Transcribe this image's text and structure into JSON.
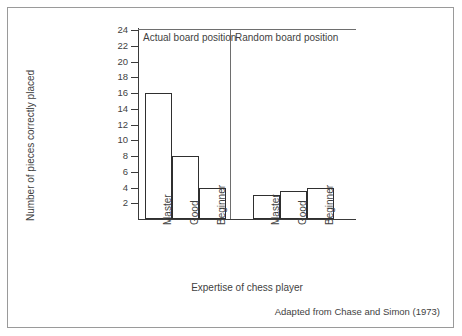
{
  "figure": {
    "source_note": "Adapted from Chase and Simon (1973)"
  },
  "chart_data": {
    "type": "bar",
    "title": "",
    "subtitle": "",
    "xlabel": "Expertise of chess player",
    "ylabel": "Number of pieces correctly placed",
    "ylim": [
      0,
      24
    ],
    "ytick_step": 2,
    "yticks": [
      2,
      4,
      6,
      8,
      10,
      12,
      14,
      16,
      18,
      20,
      22,
      24
    ],
    "ytick_labels": [
      "2",
      "4",
      "6",
      "8",
      "10",
      "12",
      "14",
      "16",
      "18",
      "20",
      "22",
      "24"
    ],
    "grid": false,
    "legend": "none",
    "categories": [
      "Master",
      "Good",
      "Beginner"
    ],
    "panels": [
      {
        "label": "Actual board position",
        "categories": [
          "Master",
          "Good",
          "Beginner"
        ],
        "values": [
          16,
          8,
          4
        ]
      },
      {
        "label": "Random board position",
        "categories": [
          "Master",
          "Good",
          "Beginner"
        ],
        "values": [
          3,
          3.5,
          4
        ]
      }
    ],
    "series": [
      {
        "name": "Actual board position",
        "values": [
          16,
          8,
          4
        ]
      },
      {
        "name": "Random board position",
        "values": [
          3,
          3.5,
          4
        ]
      }
    ],
    "annotations": [
      "Adapted from Chase and Simon (1973)"
    ],
    "colors": {
      "bar_fill": "#ffffff",
      "bar_edge": "#2f2f2f",
      "axis": "#3a3a3a",
      "text": "#3f3f3f",
      "frame": "#9a9a9a",
      "background": "#ffffff"
    }
  }
}
